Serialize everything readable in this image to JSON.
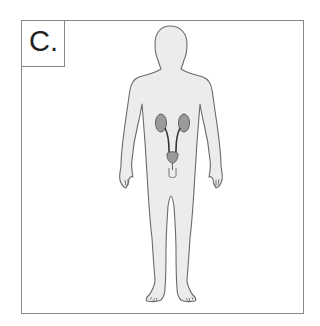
{
  "panel": {
    "label": "C.",
    "subject": "human body outline",
    "highlighted_system": "urinary system",
    "organs": [
      "left kidney",
      "right kidney",
      "ureters",
      "bladder"
    ]
  },
  "colors": {
    "body_fill": "#ececec",
    "body_outline": "#6a6a6a",
    "organ_fill": "#9a9a9a",
    "organ_outline": "#555555",
    "frame": "#8a8a8a"
  }
}
